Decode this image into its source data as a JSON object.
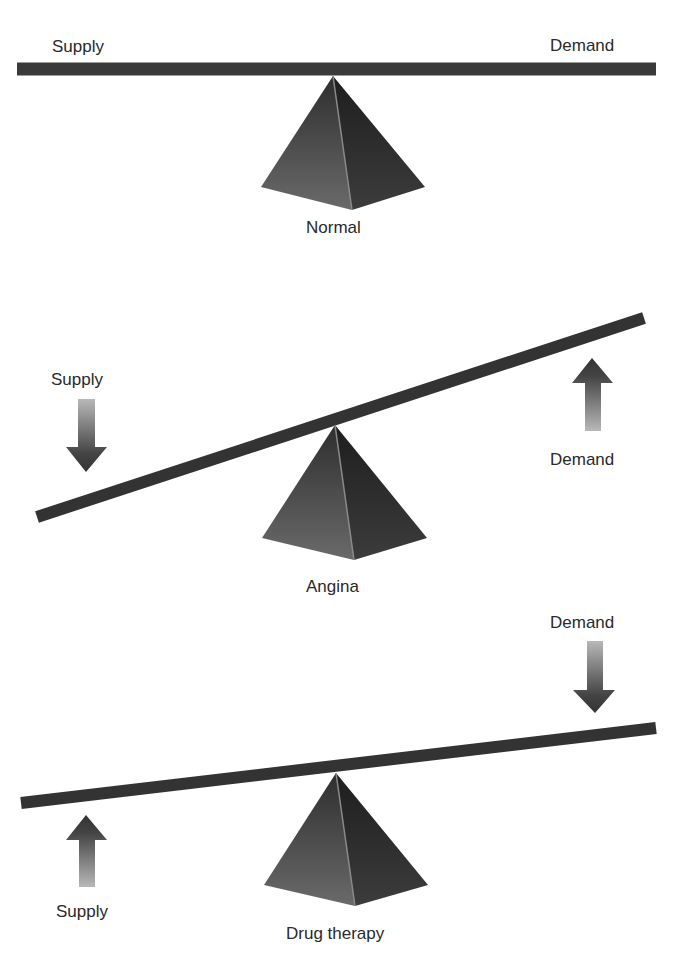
{
  "panels": [
    {
      "name": "normal",
      "caption": "Normal",
      "supply_label": "Supply",
      "demand_label": "Demand",
      "supply_arrow": "none",
      "demand_arrow": "none"
    },
    {
      "name": "angina",
      "caption": "Angina",
      "supply_label": "Supply",
      "demand_label": "Demand",
      "supply_arrow": "down",
      "demand_arrow": "up"
    },
    {
      "name": "drug-therapy",
      "caption": "Drug therapy",
      "supply_label": "Supply",
      "demand_label": "Demand",
      "supply_arrow": "up",
      "demand_arrow": "down"
    }
  ],
  "colors": {
    "beam": "#3a3a3a",
    "pyramid_left": "#5a5a5a",
    "pyramid_right": "#2e2e2e",
    "arrow_dark": "#3a3a3a",
    "arrow_light": "#b5b5b5",
    "text": "#2a2a2a"
  }
}
